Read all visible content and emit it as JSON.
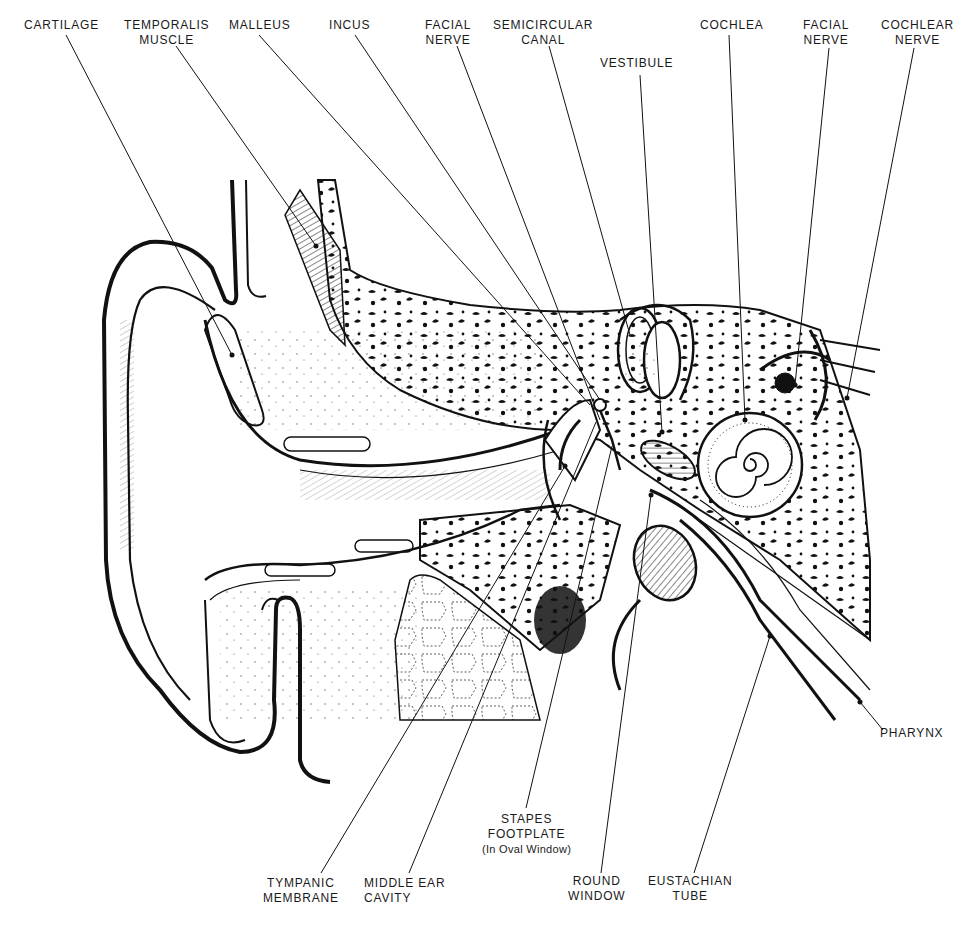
{
  "diagram": {
    "type": "anatomical-cross-section",
    "ink_color": "#111111",
    "background": "#ffffff",
    "labels_top": [
      {
        "id": "cartilage",
        "lines": [
          "CARTILAGE"
        ]
      },
      {
        "id": "temporalis-muscle",
        "lines": [
          "TEMPORALIS",
          "MUSCLE"
        ]
      },
      {
        "id": "malleus",
        "lines": [
          "MALLEUS"
        ]
      },
      {
        "id": "incus",
        "lines": [
          "INCUS"
        ]
      },
      {
        "id": "facial-nerve-1",
        "lines": [
          "FACIAL",
          "NERVE"
        ]
      },
      {
        "id": "semicircular-canal",
        "lines": [
          "SEMICIRCULAR",
          "CANAL"
        ]
      },
      {
        "id": "vestibule",
        "lines": [
          "VESTIBULE"
        ]
      },
      {
        "id": "cochlea",
        "lines": [
          "COCHLEA"
        ]
      },
      {
        "id": "facial-nerve-2",
        "lines": [
          "FACIAL",
          "NERVE"
        ]
      },
      {
        "id": "cochlear-nerve",
        "lines": [
          "COCHLEAR",
          "NERVE"
        ]
      }
    ],
    "labels_right": [
      {
        "id": "pharynx",
        "lines": [
          "PHARYNX"
        ]
      }
    ],
    "labels_bottom": [
      {
        "id": "stapes-footplate",
        "lines": [
          "STAPES",
          "FOOTPLATE",
          "(In Oval Window)"
        ]
      },
      {
        "id": "tympanic-membrane",
        "lines": [
          "TYMPANIC",
          "MEMBRANE"
        ]
      },
      {
        "id": "middle-ear-cavity",
        "lines": [
          "MIDDLE EAR",
          "CAVITY"
        ]
      },
      {
        "id": "round-window",
        "lines": [
          "ROUND",
          "WINDOW"
        ]
      },
      {
        "id": "eustachian-tube",
        "lines": [
          "EUSTACHIAN",
          "TUBE"
        ]
      }
    ]
  },
  "labels": {
    "cartilage": "CARTILAGE",
    "temporalis_1": "TEMPORALIS",
    "temporalis_2": "MUSCLE",
    "malleus": "MALLEUS",
    "incus": "INCUS",
    "facial1_1": "FACIAL",
    "facial1_2": "NERVE",
    "semicircular_1": "SEMICIRCULAR",
    "semicircular_2": "CANAL",
    "vestibule": "VESTIBULE",
    "cochlea": "COCHLEA",
    "facial2_1": "FACIAL",
    "facial2_2": "NERVE",
    "cochlear_1": "COCHLEAR",
    "cochlear_2": "NERVE",
    "pharynx": "PHARYNX",
    "stapes_1": "STAPES",
    "stapes_2": "FOOTPLATE",
    "stapes_3": "(In Oval Window)",
    "tympanic_1": "TYMPANIC",
    "tympanic_2": "MEMBRANE",
    "middle_1": "MIDDLE EAR",
    "middle_2": "CAVITY",
    "round_1": "ROUND",
    "round_2": "WINDOW",
    "eustachian_1": "EUSTACHIAN",
    "eustachian_2": "TUBE"
  }
}
